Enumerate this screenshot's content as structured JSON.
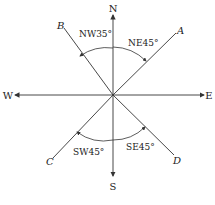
{
  "directions": {
    "north": "N",
    "south": "S",
    "east": "E",
    "west": "W"
  },
  "lines": [
    {
      "label": "A",
      "bearing": "NE45°"
    },
    {
      "label": "B",
      "bearing": "NW35°"
    },
    {
      "label": "C",
      "bearing": "SW45°"
    },
    {
      "label": "D",
      "bearing": "SE45°"
    }
  ],
  "colors": {
    "stroke": "#333333",
    "background": "#ffffff"
  }
}
